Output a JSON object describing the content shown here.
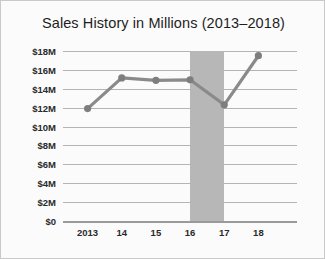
{
  "chart_data": {
    "type": "line",
    "title": "Sales History in Millions (2013–2018)",
    "xlabel": "",
    "ylabel": "",
    "categories": [
      "2013",
      "14",
      "15",
      "16",
      "17",
      "18"
    ],
    "x": [
      2013,
      2014,
      2015,
      2016,
      2017,
      2018
    ],
    "values": [
      11.9,
      15.15,
      14.9,
      14.95,
      12.3,
      17.5
    ],
    "series": [
      {
        "name": "Sales",
        "values": [
          11.9,
          15.15,
          14.9,
          14.95,
          12.3,
          17.5
        ]
      }
    ],
    "ylim": [
      0,
      18
    ],
    "yticks": [
      0,
      2,
      4,
      6,
      8,
      10,
      12,
      14,
      16,
      18
    ],
    "ytick_labels": [
      "$0",
      "$2M",
      "$4M",
      "$6M",
      "$8M",
      "$10M",
      "$12M",
      "$14M",
      "$16M",
      "$18M"
    ],
    "xtick_labels": [
      "2013",
      "14",
      "15",
      "16",
      "17",
      "18"
    ],
    "grid": true,
    "legend": "none",
    "annotations": [
      {
        "name": "shaded-band",
        "type": "vertical-band",
        "x_start": 2016,
        "x_end": 2017,
        "color": "#b7b7b7"
      }
    ],
    "colors": {
      "line": "#8a8a8a",
      "marker": "#7e7e7e",
      "grid": "#b4b4b4",
      "axis": "#9a9a9a",
      "band": "#b7b7b7",
      "text": "#1e1e1e",
      "background": "#fbfbfb"
    }
  }
}
